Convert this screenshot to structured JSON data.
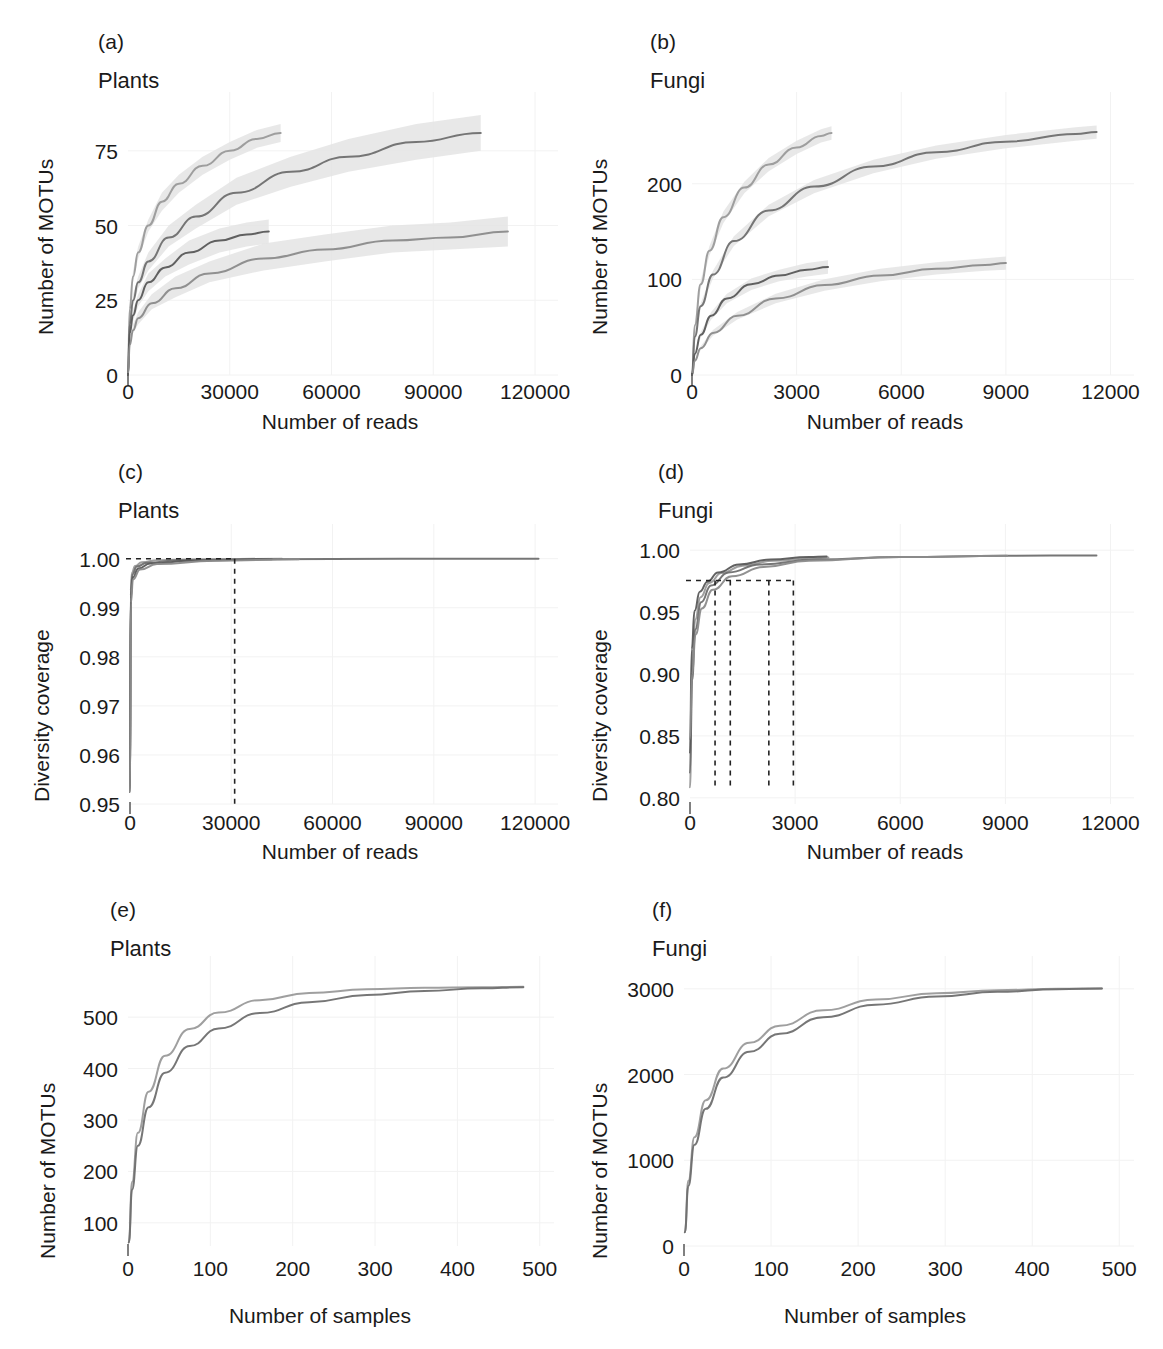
{
  "figure": {
    "background": "#ffffff"
  },
  "labels": {
    "number_of_motus": "Number of MOTUs",
    "number_of_reads": "Number of reads",
    "number_of_samples": "Number of samples",
    "diversity_coverage": "Diversity coverage",
    "plants": "Plants",
    "fungi": "Fungi",
    "a": "(a)",
    "b": "(b)",
    "c": "(c)",
    "d": "(d)",
    "e": "(e)",
    "f": "(f)"
  },
  "colors": {
    "series_1": "#9a9a9a",
    "series_2": "#6f6f6f",
    "series_3": "#585858",
    "series_4": "#8b8b8b",
    "band": "#e4e4e4",
    "axis": "#4a4a4a",
    "grid": "#f2f2f2",
    "text": "#1a1a1a",
    "dashed": "#222222"
  },
  "chart_data": [
    {
      "id": "panel_a",
      "type": "line",
      "panel": "(a)",
      "title": "Plants",
      "xlabel": "Number of reads",
      "ylabel": "Number of MOTUs",
      "xlim": [
        0,
        125000
      ],
      "ylim": [
        0,
        88
      ],
      "xticks": [
        0,
        30000,
        60000,
        90000,
        120000
      ],
      "xticklabels": [
        "0",
        "30000",
        "60000",
        "90000",
        "120000"
      ],
      "yticks": [
        0,
        25,
        50,
        75
      ],
      "yticklabels": [
        "0",
        "25",
        "50",
        "75"
      ],
      "grid": true,
      "legend": "none",
      "series": [
        {
          "name": "series_1",
          "color": "#9a9a9a",
          "band": true,
          "x": [
            0,
            500,
            1500,
            3000,
            6000,
            10000,
            15000,
            22000,
            30000,
            38000,
            45000
          ],
          "y": [
            0,
            22,
            33,
            41,
            50,
            58,
            64,
            70,
            75,
            79,
            81
          ],
          "band_lo": [
            0,
            20,
            31,
            39,
            48,
            55,
            61,
            67,
            72,
            76,
            78
          ],
          "band_hi": [
            0,
            24,
            35,
            43,
            52,
            61,
            67,
            73,
            78,
            82,
            84
          ]
        },
        {
          "name": "series_2",
          "color": "#6f6f6f",
          "band": true,
          "x": [
            0,
            500,
            1500,
            3000,
            6000,
            12000,
            20000,
            32000,
            48000,
            65000,
            85000,
            104000
          ],
          "y": [
            0,
            17,
            25,
            31,
            38,
            46,
            53,
            61,
            68,
            73,
            78,
            81
          ],
          "band_lo": [
            0,
            15,
            23,
            29,
            35,
            43,
            49,
            57,
            63,
            68,
            72,
            75
          ],
          "band_hi": [
            0,
            19,
            27,
            33,
            41,
            50,
            57,
            66,
            73,
            79,
            84,
            87
          ]
        },
        {
          "name": "series_3",
          "color": "#585858",
          "band": true,
          "x": [
            0,
            500,
            1500,
            3000,
            6000,
            11000,
            18000,
            27000,
            35000,
            41500
          ],
          "y": [
            0,
            14,
            20,
            25,
            31,
            36,
            41,
            45,
            47,
            48
          ],
          "band_lo": [
            0,
            12,
            18,
            23,
            28,
            33,
            37,
            41,
            43,
            44
          ],
          "band_hi": [
            0,
            16,
            22,
            27,
            34,
            39,
            45,
            49,
            51,
            52
          ]
        },
        {
          "name": "series_4",
          "color": "#8b8b8b",
          "band": true,
          "x": [
            0,
            500,
            1500,
            3000,
            7000,
            14000,
            24000,
            40000,
            58000,
            78000,
            95000,
            112000
          ],
          "y": [
            0,
            10,
            15,
            19,
            24,
            29,
            34,
            39,
            42,
            45,
            46,
            48
          ],
          "band_lo": [
            0,
            9,
            14,
            17,
            22,
            26,
            31,
            35,
            38,
            41,
            42,
            43
          ],
          "band_hi": [
            0,
            11,
            17,
            21,
            27,
            33,
            38,
            44,
            47,
            50,
            51,
            53
          ]
        }
      ]
    },
    {
      "id": "panel_b",
      "type": "line",
      "panel": "(b)",
      "title": "Fungi",
      "xlabel": "Number of reads",
      "ylabel": "Number of MOTUs",
      "xlim": [
        0,
        12500
      ],
      "ylim": [
        0,
        275
      ],
      "xticks": [
        0,
        3000,
        6000,
        9000,
        12000
      ],
      "xticklabels": [
        "0",
        "3000",
        "6000",
        "9000",
        "12000"
      ],
      "yticks": [
        0,
        100,
        200
      ],
      "yticklabels": [
        "0",
        "100",
        "200"
      ],
      "grid": true,
      "legend": "none",
      "series": [
        {
          "name": "series_1",
          "color": "#9a9a9a",
          "band": true,
          "x": [
            0,
            80,
            250,
            500,
            900,
            1500,
            2200,
            3000,
            3700,
            4000
          ],
          "y": [
            0,
            52,
            95,
            130,
            165,
            196,
            220,
            238,
            250,
            253
          ],
          "band_lo": [
            0,
            49,
            91,
            125,
            159,
            190,
            213,
            231,
            243,
            246
          ],
          "band_hi": [
            0,
            55,
            99,
            135,
            171,
            202,
            227,
            245,
            257,
            260
          ]
        },
        {
          "name": "series_2",
          "color": "#6f6f6f",
          "band": true,
          "x": [
            0,
            80,
            250,
            600,
            1200,
            2200,
            3500,
            5200,
            7000,
            9000,
            11000,
            11600
          ],
          "y": [
            0,
            40,
            72,
            105,
            140,
            172,
            197,
            218,
            233,
            244,
            252,
            254
          ],
          "band_lo": [
            0,
            38,
            69,
            101,
            135,
            166,
            190,
            211,
            226,
            237,
            245,
            247
          ],
          "band_hi": [
            0,
            42,
            75,
            109,
            145,
            178,
            204,
            225,
            240,
            251,
            259,
            261
          ]
        },
        {
          "name": "series_3",
          "color": "#585858",
          "band": true,
          "x": [
            0,
            80,
            250,
            550,
            1000,
            1700,
            2500,
            3300,
            3900
          ],
          "y": [
            0,
            22,
            42,
            62,
            80,
            95,
            104,
            110,
            113
          ],
          "band_lo": [
            0,
            20,
            39,
            58,
            75,
            89,
            98,
            103,
            106
          ],
          "band_hi": [
            0,
            24,
            45,
            66,
            85,
            101,
            110,
            117,
            120
          ]
        },
        {
          "name": "series_4",
          "color": "#8b8b8b",
          "band": true,
          "x": [
            0,
            80,
            250,
            600,
            1300,
            2400,
            3800,
            5400,
            7000,
            8400,
            9000
          ],
          "y": [
            0,
            15,
            28,
            44,
            62,
            80,
            94,
            104,
            111,
            115,
            117
          ],
          "band_lo": [
            0,
            14,
            26,
            41,
            58,
            75,
            88,
            98,
            105,
            109,
            110
          ],
          "band_hi": [
            0,
            16,
            30,
            47,
            66,
            85,
            100,
            111,
            118,
            122,
            124
          ]
        }
      ]
    },
    {
      "id": "panel_c",
      "type": "line",
      "panel": "(c)",
      "title": "Plants",
      "xlabel": "Number of reads",
      "ylabel": "Diversity coverage",
      "xlim": [
        0,
        125000
      ],
      "ylim": [
        0.95,
        1.003
      ],
      "xticks": [
        0,
        30000,
        60000,
        90000,
        120000
      ],
      "xticklabels": [
        "0",
        "30000",
        "60000",
        "90000",
        "120000"
      ],
      "yticks": [
        0.95,
        0.96,
        0.97,
        0.98,
        0.99,
        1.0
      ],
      "yticklabels": [
        "0.95",
        "0.96",
        "0.97",
        "0.98",
        "0.99",
        "1.00"
      ],
      "grid": true,
      "legend": "none",
      "annotations": {
        "hline_y": 1.0,
        "hline_x_end": 31000,
        "vline_x": 31000,
        "vline_y_bottom": 0.95
      },
      "series": [
        {
          "name": "series_1",
          "color": "#9a9a9a",
          "band": false,
          "x": [
            0,
            200,
            600,
            1500,
            3500,
            8000,
            20000,
            45000
          ],
          "y": [
            0.9525,
            0.9935,
            0.9972,
            0.9985,
            0.9993,
            0.9997,
            0.9999,
            1.0
          ]
        },
        {
          "name": "series_2",
          "color": "#6f6f6f",
          "band": false,
          "x": [
            0,
            200,
            700,
            2000,
            5000,
            15000,
            40000,
            80000,
            121000
          ],
          "y": [
            0.9525,
            0.9925,
            0.9968,
            0.9984,
            0.9992,
            0.9997,
            0.9999,
            1.0,
            1.0
          ]
        },
        {
          "name": "series_3",
          "color": "#585858",
          "band": false,
          "x": [
            0,
            200,
            800,
            2500,
            6000,
            18000,
            42000
          ],
          "y": [
            0.9525,
            0.9918,
            0.9962,
            0.998,
            0.999,
            0.9996,
            0.9999
          ]
        },
        {
          "name": "series_4",
          "color": "#8b8b8b",
          "band": false,
          "x": [
            0,
            250,
            900,
            3000,
            8000,
            25000,
            50000
          ],
          "y": [
            0.9525,
            0.991,
            0.9958,
            0.9978,
            0.9989,
            0.9996,
            0.9999
          ]
        }
      ]
    },
    {
      "id": "panel_d",
      "type": "line",
      "panel": "(d)",
      "title": "Fungi",
      "xlabel": "Number of reads",
      "ylabel": "Diversity coverage",
      "xlim": [
        0,
        12500
      ],
      "ylim": [
        0.795,
        1.005
      ],
      "xticks": [
        0,
        3000,
        6000,
        9000,
        12000
      ],
      "xticklabels": [
        "0",
        "3000",
        "6000",
        "9000",
        "12000"
      ],
      "yticks": [
        0.8,
        0.85,
        0.9,
        0.95,
        1.0
      ],
      "yticklabels": [
        "0.80",
        "0.85",
        "0.90",
        "0.95",
        "1.00"
      ],
      "grid": true,
      "legend": "none",
      "annotations": {
        "hline_y": 0.9755,
        "hline_x_end": 2950,
        "vlines_x": [
          715,
          1150,
          2250,
          2950
        ],
        "vline_y_bottom": 0.8
      },
      "series": [
        {
          "name": "series_1",
          "color": "#9a9a9a",
          "band": false,
          "x": [
            0,
            60,
            150,
            300,
            550,
            900,
            1500,
            2400,
            3500,
            3950
          ],
          "y": [
            0.8085,
            0.905,
            0.944,
            0.962,
            0.9735,
            0.9815,
            0.9875,
            0.9915,
            0.9935,
            0.994
          ]
        },
        {
          "name": "series_2",
          "color": "#6f6f6f",
          "band": false,
          "x": [
            0,
            60,
            150,
            320,
            600,
            1100,
            2000,
            3600,
            6000,
            9000,
            11600
          ],
          "y": [
            0.8205,
            0.895,
            0.936,
            0.958,
            0.9715,
            0.982,
            0.9885,
            0.9925,
            0.9945,
            0.9955,
            0.9958
          ]
        },
        {
          "name": "series_3",
          "color": "#585858",
          "band": false,
          "x": [
            0,
            50,
            130,
            280,
            500,
            800,
            1400,
            2300,
            3400,
            3900
          ],
          "y": [
            0.8365,
            0.92,
            0.951,
            0.9665,
            0.9745,
            0.982,
            0.9885,
            0.9925,
            0.9945,
            0.995
          ]
        },
        {
          "name": "series_4",
          "color": "#8b8b8b",
          "band": false,
          "x": [
            0,
            60,
            160,
            340,
            650,
            1200,
            2100,
            3400,
            6000,
            9050
          ],
          "y": [
            0.8475,
            0.9,
            0.932,
            0.953,
            0.968,
            0.979,
            0.9865,
            0.9915,
            0.9945,
            0.9955
          ]
        }
      ]
    },
    {
      "id": "panel_e",
      "type": "line",
      "panel": "(e)",
      "title": "Plants",
      "xlabel": "Number of samples",
      "ylabel": "Number of MOTUs",
      "xlim": [
        0,
        510
      ],
      "ylim": [
        55,
        580
      ],
      "xticks": [
        0,
        100,
        200,
        300,
        400,
        500
      ],
      "xticklabels": [
        "0",
        "100",
        "200",
        "300",
        "400",
        "500"
      ],
      "yticks": [
        100,
        200,
        300,
        400,
        500
      ],
      "yticklabels": [
        "100",
        "200",
        "300",
        "400",
        "500"
      ],
      "grid": true,
      "legend": "none",
      "series": [
        {
          "name": "series_1",
          "color": "#9a9a9a",
          "band": false,
          "x": [
            1,
            5,
            12,
            25,
            45,
            75,
            110,
            160,
            220,
            290,
            360,
            430,
            480
          ],
          "y": [
            62,
            180,
            275,
            355,
            425,
            477,
            509,
            533,
            547,
            554,
            557,
            558,
            559
          ]
        },
        {
          "name": "series_2",
          "color": "#6f6f6f",
          "band": false,
          "x": [
            1,
            5,
            12,
            25,
            45,
            75,
            110,
            160,
            220,
            290,
            360,
            430,
            480
          ],
          "y": [
            62,
            165,
            250,
            325,
            392,
            444,
            478,
            508,
            529,
            543,
            551,
            556,
            558
          ]
        }
      ]
    },
    {
      "id": "panel_f",
      "type": "line",
      "panel": "(f)",
      "title": "Fungi",
      "xlabel": "Number of samples",
      "ylabel": "Number of MOTUs",
      "xlim": [
        0,
        510
      ],
      "ylim": [
        0,
        3150
      ],
      "xticks": [
        0,
        100,
        200,
        300,
        400,
        500
      ],
      "xticklabels": [
        "0",
        "100",
        "200",
        "300",
        "400",
        "500"
      ],
      "yticks": [
        0,
        1000,
        2000,
        3000
      ],
      "yticklabels": [
        "0",
        "1000",
        "2000",
        "3000"
      ],
      "grid": true,
      "legend": "none",
      "series": [
        {
          "name": "series_1",
          "color": "#9a9a9a",
          "band": false,
          "x": [
            1,
            5,
            12,
            25,
            45,
            75,
            110,
            160,
            220,
            290,
            360,
            430,
            480
          ],
          "y": [
            160,
            760,
            1270,
            1700,
            2070,
            2370,
            2570,
            2750,
            2875,
            2950,
            2985,
            3000,
            3005
          ],
          "band_lo": [],
          "band_hi": []
        },
        {
          "name": "series_2",
          "color": "#6f6f6f",
          "band": false,
          "x": [
            1,
            5,
            12,
            25,
            45,
            75,
            110,
            160,
            220,
            290,
            360,
            430,
            480
          ],
          "y": [
            160,
            700,
            1180,
            1600,
            1965,
            2265,
            2475,
            2670,
            2815,
            2910,
            2965,
            2995,
            3005
          ]
        }
      ]
    }
  ]
}
